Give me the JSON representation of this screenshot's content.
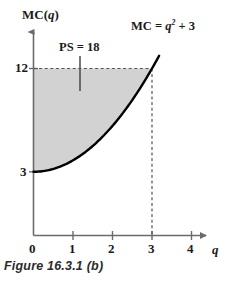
{
  "figure": {
    "caption": "Figure 16.3.1 (b)",
    "y_axis_title": "MC(q)",
    "x_axis_title": "q",
    "curve_equation_prefix": "MC = ",
    "curve_equation_base": "q",
    "curve_equation_exponent": "2",
    "curve_equation_suffix": " + 3",
    "ps_annotation": "PS = 18"
  },
  "colors": {
    "shade_fill": "#d2d2d2",
    "curve_stroke": "#000000",
    "axis_stroke": "#6b6b6b",
    "dashed_stroke": "#6b6b6b",
    "text": "#1a1a1a",
    "caption_text": "#2b2b2b",
    "background": "#ffffff"
  },
  "chart_data": {
    "type": "line",
    "title": "Figure 16.3.1 (b)",
    "xlabel": "q",
    "ylabel": "MC(q)",
    "equation": "MC = q^2 + 3",
    "xlim": [
      0,
      4.5
    ],
    "ylim": [
      0,
      14
    ],
    "grid": false,
    "legend": "none",
    "x_ticks": [
      0,
      1,
      2,
      3,
      4
    ],
    "x_tick_labels": [
      "0",
      "1",
      "2",
      "3",
      "4"
    ],
    "y_ticks": [
      3,
      12
    ],
    "y_tick_labels": [
      "3",
      "12"
    ],
    "series": [
      {
        "name": "MC = q^2 + 3",
        "x": [
          0,
          0.25,
          0.5,
          0.75,
          1,
          1.25,
          1.5,
          1.75,
          2,
          2.25,
          2.5,
          2.75,
          3,
          3.15
        ],
        "values": [
          3,
          3.06,
          3.25,
          3.56,
          4,
          4.56,
          5.25,
          6.06,
          7,
          8.06,
          9.25,
          10.56,
          12,
          12.92
        ]
      }
    ],
    "annotations": [
      {
        "text": "PS = 18",
        "kind": "producer-surplus-shaded-region",
        "value": 18,
        "region_x_range": [
          0,
          3
        ],
        "region_upper_bound": 12,
        "region_lower_bound_curve": "MC = q^2 + 3"
      },
      {
        "text": "MC = q^2 + 3",
        "kind": "curve-label"
      }
    ],
    "reference_lines": [
      {
        "orientation": "horizontal",
        "value": 12,
        "style": "dashed",
        "from_x": 0,
        "to_x": 3
      },
      {
        "orientation": "vertical",
        "value": 3,
        "style": "dashed",
        "from_y": 0,
        "to_y": 12
      }
    ]
  }
}
